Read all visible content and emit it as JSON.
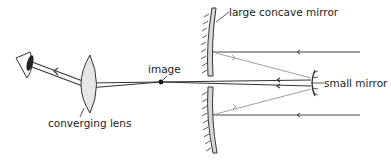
{
  "diagram": {
    "type": "optics-ray-diagram",
    "labels": {
      "large_mirror": "large concave mirror",
      "small_mirror": "small mirror",
      "image": "image",
      "lens": "converging lens"
    },
    "components": [
      "eye",
      "converging lens",
      "image point",
      "large concave mirror",
      "small mirror"
    ],
    "colors": {
      "ray": "#333333",
      "reflected_ray": "#999999",
      "mirror_fill": "#d9d9d9",
      "lens_fill": "#e6e6e6",
      "eye_pupil": "#222222"
    }
  }
}
